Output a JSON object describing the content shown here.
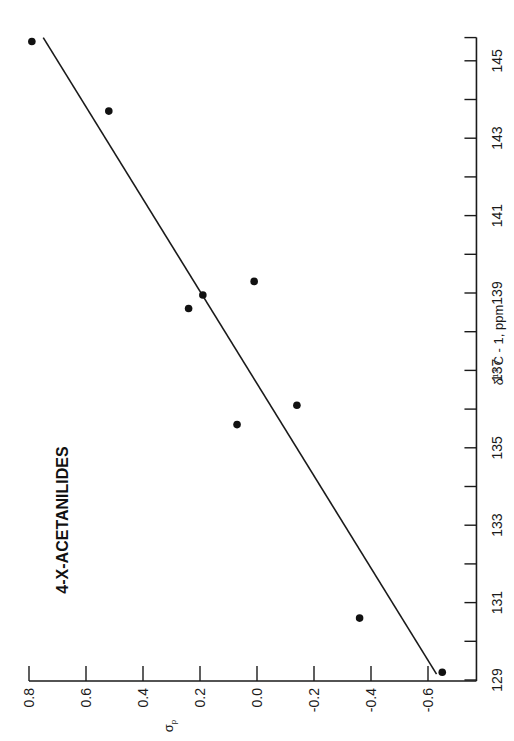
{
  "chart_data": {
    "type": "scatter",
    "title": "4-X-ACETANILIDES",
    "orientation": "rotated 90° counter-clockwise",
    "xlabel": "δ¹³ C - 1, ppm",
    "xlabel_parts": {
      "delta": "δ",
      "sup": "13",
      "rest": " C - 1, ppm"
    },
    "ylabel": "σp",
    "ylabel_parts": {
      "sigma": "σ",
      "sub": "p"
    },
    "xlim": [
      129,
      145.6
    ],
    "ylim": [
      -0.77,
      0.8
    ],
    "x_ticks": [
      129,
      130,
      131,
      132,
      133,
      134,
      135,
      136,
      137,
      138,
      139,
      140,
      141,
      142,
      143,
      144,
      145
    ],
    "x_tick_labels": [
      "129",
      "131",
      "133",
      "135",
      "137",
      "139",
      "141",
      "143",
      "145"
    ],
    "x_tick_label_values": [
      129,
      131,
      133,
      135,
      137,
      139,
      141,
      143,
      145
    ],
    "y_ticks": [
      0.8,
      0.6,
      0.4,
      0.2,
      0.0,
      -0.2,
      -0.4,
      -0.6
    ],
    "y_tick_labels": [
      "0.8",
      "0.6",
      "0.4",
      "0.2",
      "0.0",
      "-0.2",
      "-0.4",
      "-0.6"
    ],
    "grid": false,
    "legend": "none",
    "points": [
      {
        "x": 145.5,
        "y": 0.79
      },
      {
        "x": 143.7,
        "y": 0.52
      },
      {
        "x": 138.6,
        "y": 0.24
      },
      {
        "x": 138.95,
        "y": 0.19
      },
      {
        "x": 139.3,
        "y": 0.01
      },
      {
        "x": 135.6,
        "y": 0.07
      },
      {
        "x": 136.1,
        "y": -0.14
      },
      {
        "x": 130.6,
        "y": -0.36
      },
      {
        "x": 129.2,
        "y": -0.65
      }
    ],
    "fit_line": {
      "x": [
        129.15,
        145.6
      ],
      "y": [
        -0.63,
        0.75
      ]
    }
  }
}
